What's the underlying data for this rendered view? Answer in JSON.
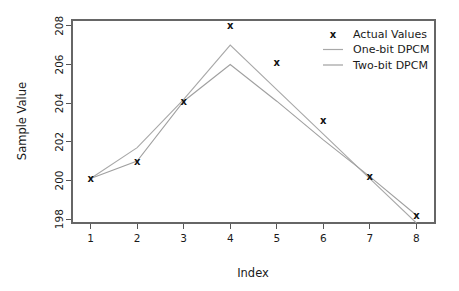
{
  "chart_data": {
    "type": "line",
    "title": "",
    "xlabel": "Index",
    "ylabel": "Sample Value",
    "x": [
      1,
      2,
      3,
      4,
      5,
      6,
      7,
      8
    ],
    "xtick_labels": [
      "1",
      "2",
      "3",
      "4",
      "5",
      "6",
      "7",
      "8"
    ],
    "ytick_labels": [
      "198",
      "200",
      "202",
      "204",
      "206",
      "208"
    ],
    "ytick_values": [
      198,
      200,
      202,
      204,
      206,
      208
    ],
    "xlim": [
      0.6,
      8.4
    ],
    "ylim": [
      197.8,
      208.3
    ],
    "grid": false,
    "legend_position": "top-right",
    "series": [
      {
        "name": "Actual Values",
        "marker": "x",
        "style": "points",
        "color": "#111111",
        "values": [
          200.1,
          201.0,
          204.1,
          208.0,
          206.1,
          203.1,
          200.2,
          198.2
        ]
      },
      {
        "name": "One-bit DPCM",
        "marker": "none",
        "style": "line",
        "color": "#a8a8a8",
        "values": [
          200.1,
          201.7,
          204.2,
          207.0,
          204.7,
          202.4,
          200.1,
          197.8
        ]
      },
      {
        "name": "Two-bit DPCM",
        "marker": "none",
        "style": "line",
        "color": "#a0a0a0",
        "values": [
          200.1,
          201.0,
          204.1,
          206.0,
          204.1,
          202.1,
          200.2,
          198.2
        ]
      }
    ]
  },
  "legend": {
    "entries": [
      {
        "label": "Actual Values",
        "glyph": "x",
        "kind": "marker"
      },
      {
        "label": "One-bit DPCM",
        "glyph": "line",
        "kind": "line"
      },
      {
        "label": "Two-bit DPCM",
        "glyph": "line",
        "kind": "line"
      }
    ]
  },
  "axes": {
    "x_title": "Index",
    "y_title": "Sample Value",
    "x_ticks": [
      "1",
      "2",
      "3",
      "4",
      "5",
      "6",
      "7",
      "8"
    ],
    "y_ticks": [
      "198",
      "200",
      "202",
      "204",
      "206",
      "208"
    ]
  },
  "colors": {
    "background": "#ffffff",
    "axis": "#555555",
    "marker": "#111111",
    "one_bit_line": "#a8a8a8",
    "two_bit_line": "#a0a0a0",
    "text": "#1a1a1a"
  }
}
